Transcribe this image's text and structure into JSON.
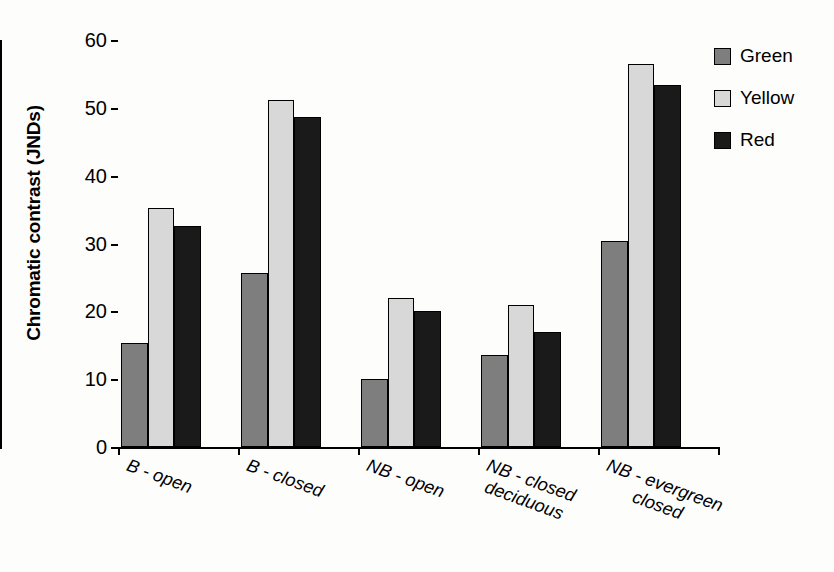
{
  "chart_data": {
    "type": "bar",
    "title": "",
    "xlabel": "",
    "ylabel": "Chromatic contrast (JNDs)",
    "ylim": [
      0,
      60
    ],
    "yticks": [
      0,
      10,
      20,
      30,
      40,
      50,
      60
    ],
    "grid": false,
    "legend_position": "top-right",
    "categories": [
      "B - open",
      "B - closed",
      "NB - open",
      "NB - closed\ndeciduous",
      "NB - evergreen\nclosed"
    ],
    "category_lines": [
      [
        "B - open"
      ],
      [
        "B - closed"
      ],
      [
        "NB - open"
      ],
      [
        "NB - closed",
        "deciduous"
      ],
      [
        "NB - evergreen",
        "closed"
      ]
    ],
    "series": [
      {
        "name": "Green",
        "color": "#7e7e7e",
        "values": [
          15.3,
          25.7,
          10.0,
          13.6,
          30.3
        ]
      },
      {
        "name": "Yellow",
        "color": "#d8d8d8",
        "values": [
          35.3,
          51.2,
          21.9,
          20.9,
          56.4
        ]
      },
      {
        "name": "Red",
        "color": "#1a1a1a",
        "values": [
          32.6,
          48.6,
          20.1,
          16.9,
          53.3
        ]
      }
    ]
  },
  "legend": {
    "items": [
      {
        "label": "Green"
      },
      {
        "label": "Yellow"
      },
      {
        "label": "Red"
      }
    ]
  },
  "axes": {
    "y_title": "Chromatic contrast (JNDs)",
    "y_tick_labels": [
      "0",
      "10",
      "20",
      "30",
      "40",
      "50",
      "60"
    ]
  }
}
